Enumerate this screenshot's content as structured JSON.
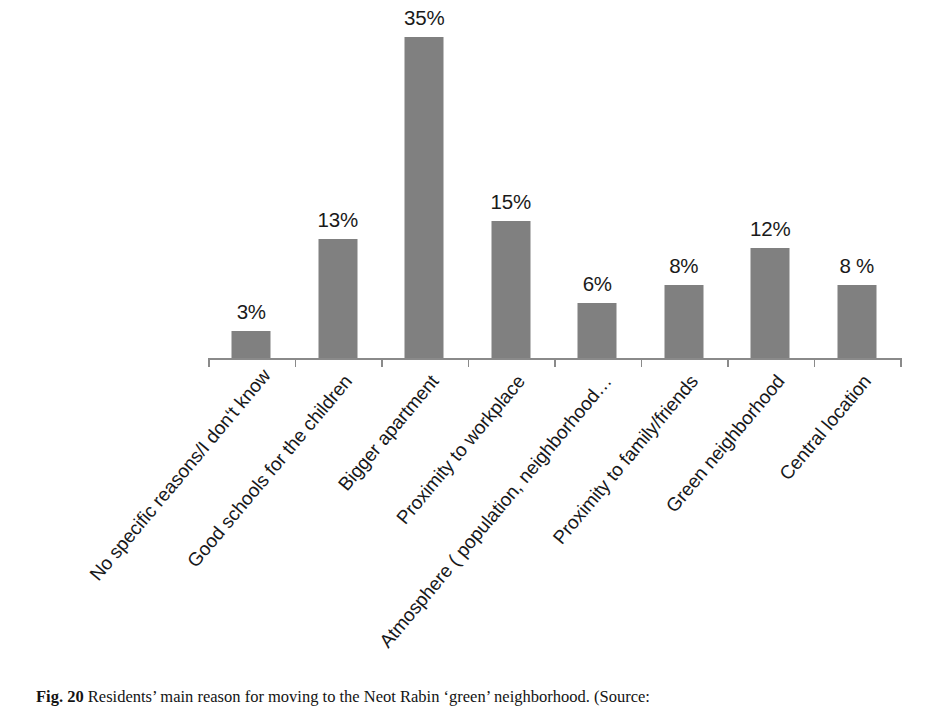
{
  "figure": {
    "caption_label": "Fig. 20",
    "caption_text": "Residents’ main reason for moving to the Neot Rabin ‘green’ neighborhood. (Source:"
  },
  "chart_data": {
    "type": "bar",
    "title": "",
    "subtitle": "",
    "xlabel": "",
    "ylabel": "",
    "ylim": [
      0,
      38
    ],
    "grid": false,
    "legend": null,
    "axis_line": true,
    "bar_color": "#808080",
    "categories": [
      "No specific reasons/I don‘t know",
      "Good schools for the children",
      "Bigger apartment",
      "Proximity to workplace",
      "Atmosphere ( population, neighborhood…",
      "Proximity to family/friends",
      "Green neighborhood",
      "Central location"
    ],
    "values": [
      3,
      13,
      35,
      15,
      6,
      8,
      12,
      8
    ],
    "value_labels": [
      "3%",
      "13%",
      "35%",
      "15%",
      "6%",
      "8%",
      "12%",
      "8 %"
    ]
  }
}
